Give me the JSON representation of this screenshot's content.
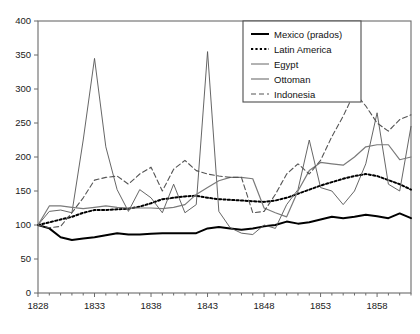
{
  "chart_data": {
    "type": "line",
    "title": "",
    "subtitle": "",
    "xlabel": "",
    "ylabel": "",
    "xlim": [
      1828,
      1861
    ],
    "ylim": [
      0,
      400
    ],
    "grid": false,
    "legend_position": "top-right",
    "x_ticks": [
      "1828",
      "1833",
      "1838",
      "1843",
      "1848",
      "1853",
      "1858"
    ],
    "x_tick_values": [
      1828,
      1833,
      1838,
      1843,
      1848,
      1853,
      1858
    ],
    "y_ticks": [
      "0",
      "50",
      "100",
      "150",
      "200",
      "250",
      "300",
      "350",
      "400"
    ],
    "y_tick_values": [
      0,
      50,
      100,
      150,
      200,
      250,
      300,
      350,
      400
    ],
    "x": [
      1828,
      1829,
      1830,
      1831,
      1832,
      1833,
      1834,
      1835,
      1836,
      1837,
      1838,
      1839,
      1840,
      1841,
      1842,
      1843,
      1844,
      1845,
      1846,
      1847,
      1848,
      1849,
      1850,
      1851,
      1852,
      1853,
      1854,
      1855,
      1856,
      1857,
      1858,
      1859,
      1860,
      1861
    ],
    "series": [
      {
        "name": "Mexico (prados)",
        "style": "solid-bold",
        "color": "#000000",
        "values": [
          100,
          95,
          82,
          78,
          80,
          82,
          85,
          88,
          86,
          86,
          87,
          88,
          88,
          88,
          88,
          95,
          97,
          95,
          93,
          95,
          98,
          100,
          105,
          102,
          104,
          108,
          112,
          110,
          112,
          115,
          113,
          110,
          117,
          110
        ]
      },
      {
        "name": "Latin America",
        "style": "dotted",
        "color": "#000000",
        "values": [
          100,
          104,
          108,
          112,
          118,
          122,
          122,
          123,
          124,
          127,
          132,
          138,
          140,
          142,
          143,
          140,
          138,
          137,
          136,
          135,
          134,
          136,
          140,
          146,
          152,
          158,
          163,
          168,
          172,
          175,
          172,
          166,
          160,
          152
        ]
      },
      {
        "name": "Egypt",
        "style": "solid-thin",
        "color": "#555555",
        "values": [
          100,
          120,
          122,
          118,
          225,
          345,
          215,
          152,
          120,
          152,
          140,
          118,
          160,
          118,
          130,
          355,
          120,
          96,
          88,
          86,
          100,
          95,
          130,
          152,
          225,
          155,
          150,
          130,
          150,
          190,
          265,
          160,
          150,
          245
        ]
      },
      {
        "name": "Ottoman",
        "style": "solid-gray",
        "color": "#7a7a7a",
        "values": [
          100,
          128,
          128,
          126,
          124,
          126,
          128,
          126,
          125,
          125,
          125,
          124,
          126,
          130,
          145,
          155,
          165,
          170,
          170,
          168,
          125,
          118,
          112,
          150,
          180,
          192,
          190,
          188,
          200,
          215,
          218,
          218,
          196,
          200
        ]
      },
      {
        "name": "Indonesia",
        "style": "dashed",
        "color": "#555555",
        "values": [
          100,
          96,
          98,
          118,
          140,
          166,
          170,
          172,
          160,
          175,
          185,
          150,
          182,
          195,
          180,
          175,
          172,
          170,
          170,
          118,
          120,
          145,
          175,
          190,
          175,
          195,
          230,
          260,
          295,
          275,
          250,
          238,
          255,
          262
        ]
      }
    ]
  },
  "legend": {
    "entries": [
      {
        "label": "Mexico (prados)"
      },
      {
        "label": "Latin America"
      },
      {
        "label": "Egypt"
      },
      {
        "label": "Ottoman"
      },
      {
        "label": "Indonesia"
      }
    ]
  },
  "axes": {
    "x_ticks": [
      "1828",
      "1833",
      "1838",
      "1843",
      "1848",
      "1853",
      "1858"
    ],
    "y_ticks": [
      "400",
      "350",
      "300",
      "250",
      "200",
      "150",
      "100",
      "50",
      "0"
    ]
  }
}
